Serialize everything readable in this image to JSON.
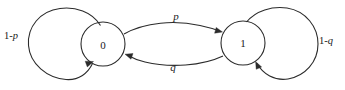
{
  "diagram": {
    "type": "markov-chain-state-diagram",
    "nodes": [
      {
        "id": "state0",
        "label": "0",
        "cx": 103,
        "cy": 44,
        "r": 22
      },
      {
        "id": "state1",
        "label": "1",
        "cx": 243,
        "cy": 43,
        "r": 22
      }
    ],
    "transitions": [
      {
        "id": "zero-to-one",
        "label": "p",
        "from": "0",
        "to": "1",
        "label_x": 176,
        "label_y": 16
      },
      {
        "id": "one-to-zero",
        "label": "q",
        "from": "1",
        "to": "0",
        "label_x": 173,
        "label_y": 67
      }
    ],
    "self_loops": [
      {
        "id": "zero-self-loop",
        "prefix": "1-",
        "variable": "p",
        "state": "0",
        "cx": 66,
        "cy": 44,
        "r": 38,
        "label_x": 4,
        "label_y": 35
      },
      {
        "id": "one-self-loop",
        "prefix": "1-",
        "variable": "q",
        "state": "1",
        "cx": 283,
        "cy": 43,
        "r": 36,
        "label_x": 319,
        "label_y": 40
      }
    ],
    "colors": {
      "stroke": "#2b2b2b",
      "text": "#1a1a1a",
      "background": "#ffffff"
    }
  }
}
